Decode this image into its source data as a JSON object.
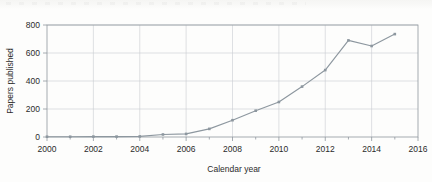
{
  "figure": {
    "name": "papers-published-by-year-line-chart"
  },
  "chart_data": {
    "type": "line",
    "title": "",
    "subtitle": "",
    "xlabel": "Calendar year",
    "ylabel": "Papers published",
    "x": [
      2000,
      2001,
      2002,
      2003,
      2004,
      2005,
      2006,
      2007,
      2008,
      2009,
      2010,
      2011,
      2012,
      2013,
      2014,
      2015
    ],
    "values": [
      2,
      2,
      3,
      3,
      4,
      18,
      22,
      58,
      120,
      188,
      250,
      360,
      478,
      690,
      650,
      735
    ],
    "series": [
      {
        "name": "Papers published",
        "values": [
          2,
          2,
          3,
          3,
          4,
          18,
          22,
          58,
          120,
          188,
          250,
          360,
          478,
          690,
          650,
          735
        ]
      }
    ],
    "xlim": [
      2000,
      2016
    ],
    "ylim": [
      0,
      840
    ],
    "x_ticks": [
      2000,
      2002,
      2004,
      2006,
      2008,
      2010,
      2012,
      2014,
      2016
    ],
    "x_tick_labels": [
      "2000",
      "2002",
      "2004",
      "2006",
      "2008",
      "2010",
      "2012",
      "2014",
      "2016"
    ],
    "x_minor_ticks": [
      2001,
      2003,
      2005,
      2007,
      2009,
      2011,
      2013,
      2015
    ],
    "y_ticks": [
      0,
      200,
      400,
      600,
      800
    ],
    "y_tick_labels": [
      "0",
      "200",
      "400",
      "600",
      "800"
    ],
    "grid": "horizontal-and-vertical",
    "legend": "none",
    "marker": "square",
    "colors": {
      "series": "#8d979f",
      "grid": "#c9cdd1",
      "frame": "#8f979e",
      "text": "#2b2b2b",
      "background": "#fdfdfc"
    }
  },
  "axes": {
    "y_label": "Papers published",
    "x_label": "Calendar year",
    "y_ticks": [
      {
        "value": 800,
        "label": "800"
      },
      {
        "value": 600,
        "label": "600"
      },
      {
        "value": 400,
        "label": "400"
      },
      {
        "value": 200,
        "label": "200"
      },
      {
        "value": 0,
        "label": "0"
      }
    ],
    "x_ticks": [
      {
        "value": 2000,
        "label": "2000"
      },
      {
        "value": 2002,
        "label": "2002"
      },
      {
        "value": 2004,
        "label": "2004"
      },
      {
        "value": 2006,
        "label": "2006"
      },
      {
        "value": 2008,
        "label": "2008"
      },
      {
        "value": 2010,
        "label": "2010"
      },
      {
        "value": 2012,
        "label": "2012"
      },
      {
        "value": 2014,
        "label": "2014"
      },
      {
        "value": 2016,
        "label": "2016"
      }
    ]
  }
}
